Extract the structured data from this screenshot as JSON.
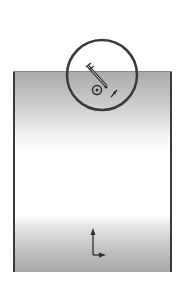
{
  "diagram": {
    "title": "",
    "colors": {
      "outline": "#3a3a3a",
      "gradient_dark": "#a8a8a8",
      "gradient_light": "#ffffff",
      "background": "#ffffff"
    },
    "elements": {
      "block": {
        "shape": "rectangle",
        "fill": "vertical-gradient"
      },
      "detail_circle": {
        "shape": "circle",
        "cx": 102,
        "cy": 75,
        "r": 35
      },
      "mechanism": {
        "parts": [
          "angled-rod",
          "wheel",
          "arrow-marker"
        ]
      },
      "axis_triad": {
        "axes": [
          "up",
          "right"
        ]
      }
    }
  }
}
